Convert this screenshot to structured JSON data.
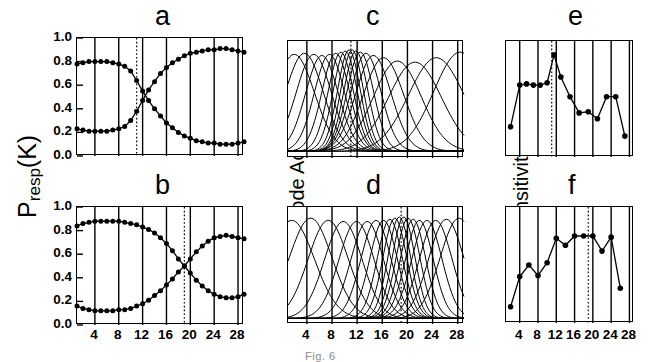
{
  "figure": {
    "width": 649,
    "height": 362,
    "caption": "Fig. 6"
  },
  "axis_titles": {
    "presp": "P",
    "presp_sub": "resp",
    "presp_tail": "(K)",
    "detector": "Detector Node Activation a",
    "detector_sub": "j",
    "sensitivity": "Sensitivity"
  },
  "x_axis": {
    "label": "",
    "ticks": [
      4,
      8,
      12,
      16,
      20,
      24,
      28
    ],
    "min": 1,
    "max": 29,
    "minor_tick_step": 4
  },
  "panels": [
    {
      "id": "a",
      "letter": "a",
      "row": "top",
      "column": "left",
      "type": "psychometric",
      "ylabel": "Presp(K)",
      "yticks": [
        "1.0",
        "0.8",
        "0.6",
        "0.4",
        "0.2",
        "0.0"
      ],
      "ylim": [
        0.0,
        1.0
      ],
      "reference_line_x": 11,
      "reference_line_style": "dotted"
    },
    {
      "id": "b",
      "letter": "b",
      "row": "bottom",
      "column": "left",
      "type": "psychometric",
      "ylabel": "Presp(K)",
      "yticks": [
        "1.0",
        "0.8",
        "0.6",
        "0.4",
        "0.2",
        "0.0"
      ],
      "ylim": [
        0.0,
        1.0
      ],
      "reference_line_x": 19,
      "reference_line_style": "dotted"
    },
    {
      "id": "c",
      "letter": "c",
      "row": "top",
      "column": "middle",
      "type": "tuning-curves",
      "ylabel": "Detector Node Activation aj",
      "yticks": [],
      "reference_line_x": 11,
      "reference_line_style": "dotted"
    },
    {
      "id": "d",
      "letter": "d",
      "row": "bottom",
      "column": "middle",
      "type": "tuning-curves",
      "ylabel": "Detector Node Activation aj",
      "yticks": [],
      "reference_line_x": 19,
      "reference_line_style": "dotted"
    },
    {
      "id": "e",
      "letter": "e",
      "row": "top",
      "column": "right",
      "type": "sensitivity",
      "ylabel": "Sensitivity",
      "yticks": [],
      "reference_line_x": 11,
      "reference_line_style": "dotted"
    },
    {
      "id": "f",
      "letter": "f",
      "row": "bottom",
      "column": "right",
      "type": "sensitivity",
      "ylabel": "Sensitivity",
      "yticks": [],
      "reference_line_x": 19,
      "reference_line_style": "dotted"
    }
  ],
  "chart_data": [
    {
      "panel": "a",
      "type": "line",
      "title": "a",
      "xlabel": "",
      "ylabel": "Presp(K)",
      "xlim": [
        1,
        29
      ],
      "ylim": [
        0.0,
        1.0
      ],
      "grid": false,
      "legend": "none",
      "marker": "filled-circle",
      "annotations": [
        {
          "type": "vline",
          "x": 11,
          "style": "dotted"
        }
      ],
      "x": [
        1,
        2,
        3,
        4,
        5,
        6,
        7,
        8,
        9,
        10,
        11,
        12,
        13,
        14,
        15,
        16,
        17,
        18,
        19,
        20,
        21,
        22,
        23,
        24,
        25,
        26,
        27,
        28,
        29
      ],
      "series": [
        {
          "name": "descending",
          "values": [
            0.78,
            0.79,
            0.8,
            0.8,
            0.8,
            0.8,
            0.79,
            0.78,
            0.76,
            0.72,
            0.64,
            0.55,
            0.47,
            0.4,
            0.34,
            0.28,
            0.24,
            0.2,
            0.17,
            0.15,
            0.13,
            0.12,
            0.11,
            0.11,
            0.1,
            0.1,
            0.1,
            0.11,
            0.12
          ]
        },
        {
          "name": "ascending",
          "values": [
            0.23,
            0.22,
            0.21,
            0.21,
            0.21,
            0.21,
            0.22,
            0.23,
            0.25,
            0.3,
            0.38,
            0.47,
            0.56,
            0.63,
            0.7,
            0.75,
            0.79,
            0.82,
            0.85,
            0.87,
            0.88,
            0.89,
            0.9,
            0.9,
            0.91,
            0.91,
            0.9,
            0.89,
            0.88
          ]
        }
      ]
    },
    {
      "panel": "b",
      "type": "line",
      "title": "b",
      "xlabel": "",
      "ylabel": "Presp(K)",
      "xlim": [
        1,
        29
      ],
      "ylim": [
        0.0,
        1.0
      ],
      "grid": false,
      "legend": "none",
      "marker": "filled-circle",
      "annotations": [
        {
          "type": "vline",
          "x": 19,
          "style": "dotted"
        }
      ],
      "x": [
        1,
        2,
        3,
        4,
        5,
        6,
        7,
        8,
        9,
        10,
        11,
        12,
        13,
        14,
        15,
        16,
        17,
        18,
        19,
        20,
        21,
        22,
        23,
        24,
        25,
        26,
        27,
        28,
        29
      ],
      "series": [
        {
          "name": "descending",
          "values": [
            0.84,
            0.86,
            0.87,
            0.88,
            0.88,
            0.88,
            0.88,
            0.88,
            0.87,
            0.86,
            0.85,
            0.83,
            0.81,
            0.78,
            0.74,
            0.69,
            0.63,
            0.56,
            0.5,
            0.44,
            0.38,
            0.33,
            0.29,
            0.26,
            0.24,
            0.23,
            0.23,
            0.24,
            0.26
          ]
        },
        {
          "name": "ascending",
          "values": [
            0.16,
            0.14,
            0.13,
            0.12,
            0.12,
            0.12,
            0.12,
            0.13,
            0.13,
            0.14,
            0.16,
            0.18,
            0.21,
            0.25,
            0.29,
            0.34,
            0.39,
            0.45,
            0.5,
            0.56,
            0.62,
            0.67,
            0.71,
            0.74,
            0.75,
            0.76,
            0.75,
            0.74,
            0.73
          ]
        }
      ]
    },
    {
      "panel": "c",
      "type": "line",
      "title": "c",
      "xlabel": "",
      "ylabel": "Detector Node Activation aj",
      "xlim": [
        1,
        29
      ],
      "ylim": [
        0.0,
        1.0
      ],
      "grid": false,
      "legend": "none",
      "marker": "none",
      "annotations": [
        {
          "type": "vline",
          "x": 11,
          "style": "dotted"
        }
      ],
      "description": "Overlapping Gaussian tuning curves, peaks densest near x=11",
      "curves": [
        {
          "peak_x": 2.0,
          "peak_y": 0.93,
          "width": 3.2,
          "baseline": 0.06
        },
        {
          "peak_x": 3.6,
          "peak_y": 0.94,
          "width": 3.0,
          "baseline": 0.06
        },
        {
          "peak_x": 5.1,
          "peak_y": 0.93,
          "width": 2.8,
          "baseline": 0.06
        },
        {
          "peak_x": 6.4,
          "peak_y": 0.92,
          "width": 2.6,
          "baseline": 0.06
        },
        {
          "peak_x": 7.6,
          "peak_y": 0.93,
          "width": 2.4,
          "baseline": 0.06
        },
        {
          "peak_x": 8.6,
          "peak_y": 0.94,
          "width": 2.2,
          "baseline": 0.06
        },
        {
          "peak_x": 9.4,
          "peak_y": 0.95,
          "width": 2.0,
          "baseline": 0.06
        },
        {
          "peak_x": 10.1,
          "peak_y": 0.96,
          "width": 1.9,
          "baseline": 0.06
        },
        {
          "peak_x": 10.7,
          "peak_y": 0.97,
          "width": 1.8,
          "baseline": 0.06
        },
        {
          "peak_x": 11.2,
          "peak_y": 0.97,
          "width": 1.8,
          "baseline": 0.06
        },
        {
          "peak_x": 11.8,
          "peak_y": 0.96,
          "width": 1.9,
          "baseline": 0.06
        },
        {
          "peak_x": 12.5,
          "peak_y": 0.95,
          "width": 2.1,
          "baseline": 0.06
        },
        {
          "peak_x": 13.4,
          "peak_y": 0.94,
          "width": 2.4,
          "baseline": 0.06
        },
        {
          "peak_x": 14.6,
          "peak_y": 0.92,
          "width": 2.8,
          "baseline": 0.06
        },
        {
          "peak_x": 16.2,
          "peak_y": 0.9,
          "width": 3.2,
          "baseline": 0.06
        },
        {
          "peak_x": 18.4,
          "peak_y": 0.87,
          "width": 3.8,
          "baseline": 0.06
        },
        {
          "peak_x": 21.2,
          "peak_y": 0.86,
          "width": 4.2,
          "baseline": 0.06
        },
        {
          "peak_x": 24.6,
          "peak_y": 0.9,
          "width": 4.4,
          "baseline": 0.06
        },
        {
          "peak_x": 28.4,
          "peak_y": 0.95,
          "width": 4.2,
          "baseline": 0.06
        }
      ]
    },
    {
      "panel": "d",
      "type": "line",
      "title": "d",
      "xlabel": "",
      "ylabel": "Detector Node Activation aj",
      "xlim": [
        1,
        29
      ],
      "ylim": [
        0.0,
        1.0
      ],
      "grid": false,
      "legend": "none",
      "marker": "none",
      "annotations": [
        {
          "type": "vline",
          "x": 19,
          "style": "dotted"
        }
      ],
      "description": "Overlapping Gaussian tuning curves, peaks densest near x=19",
      "curves": [
        {
          "peak_x": 1.6,
          "peak_y": 0.93,
          "width": 3.6,
          "baseline": 0.05
        },
        {
          "peak_x": 4.6,
          "peak_y": 0.95,
          "width": 3.4,
          "baseline": 0.05
        },
        {
          "peak_x": 7.4,
          "peak_y": 0.93,
          "width": 3.2,
          "baseline": 0.05
        },
        {
          "peak_x": 9.8,
          "peak_y": 0.92,
          "width": 3.0,
          "baseline": 0.05
        },
        {
          "peak_x": 11.9,
          "peak_y": 0.92,
          "width": 2.8,
          "baseline": 0.05
        },
        {
          "peak_x": 13.6,
          "peak_y": 0.92,
          "width": 2.6,
          "baseline": 0.05
        },
        {
          "peak_x": 15.0,
          "peak_y": 0.93,
          "width": 2.4,
          "baseline": 0.05
        },
        {
          "peak_x": 16.2,
          "peak_y": 0.93,
          "width": 2.2,
          "baseline": 0.05
        },
        {
          "peak_x": 17.2,
          "peak_y": 0.94,
          "width": 2.0,
          "baseline": 0.05
        },
        {
          "peak_x": 18.0,
          "peak_y": 0.95,
          "width": 1.9,
          "baseline": 0.05
        },
        {
          "peak_x": 18.7,
          "peak_y": 0.96,
          "width": 1.8,
          "baseline": 0.05
        },
        {
          "peak_x": 19.4,
          "peak_y": 0.96,
          "width": 1.8,
          "baseline": 0.05
        },
        {
          "peak_x": 20.1,
          "peak_y": 0.95,
          "width": 1.9,
          "baseline": 0.05
        },
        {
          "peak_x": 20.9,
          "peak_y": 0.94,
          "width": 2.0,
          "baseline": 0.05
        },
        {
          "peak_x": 21.9,
          "peak_y": 0.93,
          "width": 2.2,
          "baseline": 0.05
        },
        {
          "peak_x": 23.1,
          "peak_y": 0.93,
          "width": 2.4,
          "baseline": 0.05
        },
        {
          "peak_x": 24.5,
          "peak_y": 0.93,
          "width": 2.6,
          "baseline": 0.05
        },
        {
          "peak_x": 26.2,
          "peak_y": 0.94,
          "width": 2.8,
          "baseline": 0.05
        },
        {
          "peak_x": 28.2,
          "peak_y": 0.95,
          "width": 3.0,
          "baseline": 0.05
        }
      ]
    },
    {
      "panel": "e",
      "type": "line",
      "title": "e",
      "xlabel": "",
      "ylabel": "Sensitivity",
      "xlim": [
        1,
        29
      ],
      "ylim": [
        0.0,
        1.0
      ],
      "grid": false,
      "legend": "none",
      "marker": "filled-circle",
      "annotations": [
        {
          "type": "vline",
          "x": 11,
          "style": "dotted"
        }
      ],
      "x": [
        2,
        4,
        5.5,
        7,
        8.5,
        10,
        11.5,
        13,
        15,
        17,
        19,
        21,
        23,
        25,
        27
      ],
      "values": [
        0.26,
        0.62,
        0.63,
        0.62,
        0.62,
        0.64,
        0.88,
        0.69,
        0.52,
        0.38,
        0.39,
        0.33,
        0.52,
        0.52,
        0.18
      ]
    },
    {
      "panel": "f",
      "type": "line",
      "title": "f",
      "xlabel": "",
      "ylabel": "Sensitivity",
      "xlim": [
        1,
        29
      ],
      "ylim": [
        0.0,
        1.0
      ],
      "grid": false,
      "legend": "none",
      "marker": "filled-circle",
      "annotations": [
        {
          "type": "vline",
          "x": 19,
          "style": "dotted"
        }
      ],
      "x": [
        2,
        4,
        6,
        8,
        10,
        12,
        14,
        16,
        18,
        20,
        22,
        24,
        26
      ],
      "values": [
        0.14,
        0.4,
        0.5,
        0.41,
        0.52,
        0.73,
        0.67,
        0.75,
        0.75,
        0.75,
        0.62,
        0.74,
        0.3
      ]
    }
  ]
}
